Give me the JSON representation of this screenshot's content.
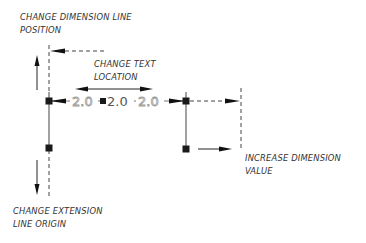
{
  "labels": {
    "dim_line_position": [
      "CHANGE DIMENSION LINE",
      "POSITION"
    ],
    "text_location": [
      "CHANGE TEXT",
      "LOCATION"
    ],
    "increase_value": [
      "INCREASE DIMENSION",
      "VALUE"
    ],
    "ext_line_origin": [
      "CHANGE EXTENSION",
      "LINE ORIGIN"
    ]
  },
  "dimension": {
    "value": "2.0",
    "ghost_left": "2.0",
    "ghost_right": "2.0"
  },
  "colors": {
    "ink": "#111111",
    "ghost": "#9a9a9a",
    "grip": "#1a1a1a"
  }
}
